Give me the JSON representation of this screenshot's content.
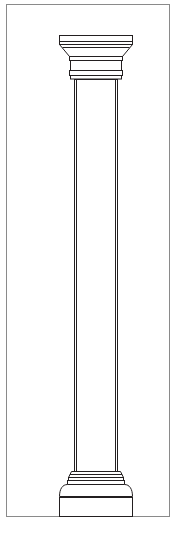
{
  "figure": {
    "kind": "architectural-line-drawing",
    "title": "",
    "caption": "",
    "background_color": "#ffffff",
    "line_color": "#231f20",
    "frame_color": "#8a8a8a",
    "fill_color": "#ffffff"
  },
  "canvas": {
    "width": 186,
    "height": 540
  },
  "frame": {
    "label": "",
    "x": 6,
    "y": 4,
    "width": 164,
    "height": 513,
    "stroke_width": 1
  },
  "column": {
    "label": "",
    "center_x": 96,
    "parts": [
      {
        "name": "abacus",
        "label": "",
        "top_y": 35,
        "bottom_y": 44,
        "half_width_top": 37,
        "half_width_bottom": 37
      },
      {
        "name": "abacus-fillet",
        "label": "",
        "top_y": 41,
        "bottom_y": 44,
        "half_width_top": 37,
        "half_width_bottom": 37
      },
      {
        "name": "echinus",
        "label": "",
        "top_y": 44,
        "bottom_y": 57,
        "half_width_top": 37,
        "half_width_bottom": 26
      },
      {
        "name": "necking-upper-band",
        "label": "",
        "top_y": 57,
        "bottom_y": 61,
        "half_width_top": 26,
        "half_width_bottom": 26
      },
      {
        "name": "necking",
        "label": "",
        "top_y": 61,
        "bottom_y": 71,
        "half_width_top": 25,
        "half_width_bottom": 25
      },
      {
        "name": "astragal",
        "label": "",
        "top_y": 71,
        "bottom_y": 79,
        "half_width_top": 26,
        "half_width_bottom": 26
      },
      {
        "name": "shaft",
        "label": "",
        "top_y": 79,
        "bottom_y": 471,
        "half_width_top": 22,
        "half_width_bottom": 22
      },
      {
        "name": "base-astragal",
        "label": "",
        "top_y": 471,
        "bottom_y": 478,
        "half_width_top": 24,
        "half_width_bottom": 27
      },
      {
        "name": "base-fillet",
        "label": "",
        "top_y": 478,
        "bottom_y": 484,
        "half_width_top": 27,
        "half_width_bottom": 28
      },
      {
        "name": "torus",
        "label": "",
        "top_y": 484,
        "bottom_y": 497,
        "half_width_top": 28,
        "half_width_bottom": 37
      },
      {
        "name": "plinth",
        "label": "",
        "top_y": 497,
        "bottom_y": 516,
        "half_width_top": 37,
        "half_width_bottom": 37
      }
    ]
  }
}
